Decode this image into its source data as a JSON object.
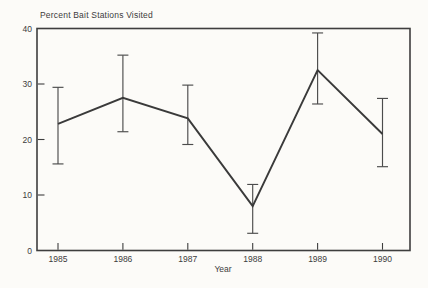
{
  "figure": {
    "title": "Percent Bait Stations Visited",
    "xlabel": "Year"
  },
  "chart_data": {
    "type": "line",
    "title": "Percent Bait Stations Visited",
    "xlabel": "Year",
    "ylabel": "Percent Bait Stations Visited",
    "categories": [
      "1985",
      "1986",
      "1987",
      "1988",
      "1989",
      "1990"
    ],
    "series": [
      {
        "name": "Percent bait stations visited",
        "values": [
          22.8,
          27.5,
          23.8,
          8.0,
          32.5,
          21.0
        ],
        "error_upper": [
          29.4,
          35.2,
          29.8,
          11.9,
          39.2,
          27.4
        ],
        "error_lower": [
          15.6,
          21.4,
          19.1,
          3.1,
          26.4,
          15.1
        ]
      }
    ],
    "ylim": [
      0,
      40
    ],
    "yticks": [
      0,
      10,
      20,
      30,
      40
    ],
    "grid": false,
    "legend": false,
    "error_bars": true,
    "line_color": "#3a3a3a",
    "error_bar_color": "#4c4c4c",
    "frame_color": "#3e3e3e",
    "text_color": "#3c3c3c",
    "background": "#fcfbf8"
  }
}
